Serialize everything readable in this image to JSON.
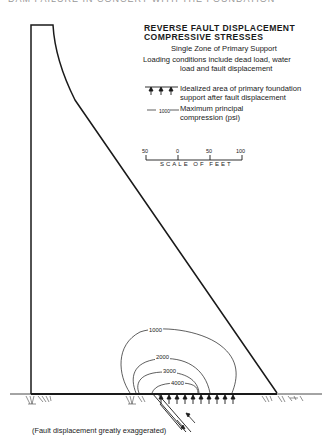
{
  "header_cutoff": "DAM FAILURE IN CONCERT WITH THE FOUNDATION",
  "title": {
    "line1": "REVERSE FAULT DISPLACEMENT",
    "line2": "COMPRESSIVE STRESSES"
  },
  "subtitle": "Single Zone of Primary Support",
  "loading": {
    "line1": "Loading conditions include dead load, water",
    "line2": "load and fault displacement"
  },
  "legend": {
    "support_line1": "Idealized area of primary foundation",
    "support_line2": "support after fault displacement",
    "contour_sample_value": "1000",
    "contour_line1": "Maximum principal",
    "contour_line2": "compression (psi)"
  },
  "scale": {
    "ticks": [
      "50",
      "0",
      "50",
      "100"
    ],
    "label": "SCALE OF FEET"
  },
  "contours": [
    {
      "value": "1000",
      "psi": 1000
    },
    {
      "value": "2000",
      "psi": 2000
    },
    {
      "value": "3000",
      "psi": 3000
    },
    {
      "value": "4000",
      "psi": 4000
    }
  ],
  "note": "(Fault displacement greatly exaggerated)",
  "colors": {
    "ink": "#1a1a1a",
    "background": "#ffffff"
  }
}
